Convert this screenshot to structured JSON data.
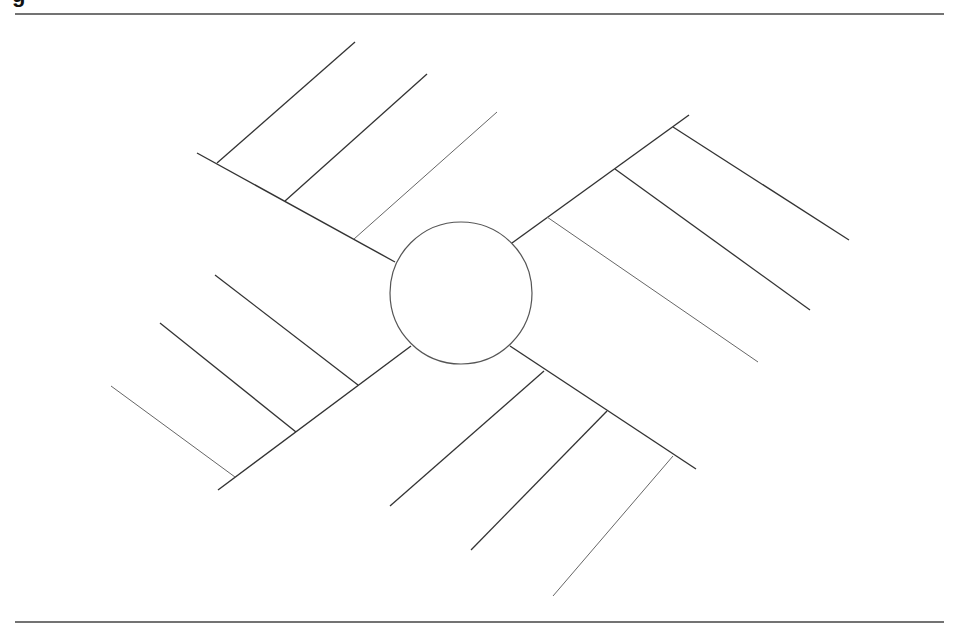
{
  "heading_fragment": "g",
  "colors": {
    "stroke_dark": "#333333",
    "stroke_light": "#666666",
    "background": "#ffffff"
  },
  "diagram": {
    "type": "spider-map",
    "top_rule": {
      "x1": 15,
      "y1": 14,
      "x2": 944,
      "y2": 14
    },
    "bottom_rule": {
      "x1": 15,
      "y1": 622,
      "x2": 944,
      "y2": 622
    },
    "center": {
      "cx": 461,
      "cy": 293,
      "r": 71,
      "label": ""
    },
    "arms": [
      {
        "name": "upper-left",
        "line": [
          197,
          153,
          395,
          262
        ],
        "branches": [
          [
            217,
            163,
            355,
            42
          ],
          [
            285,
            201,
            427,
            74
          ],
          [
            354,
            239,
            497,
            112
          ]
        ]
      },
      {
        "name": "upper-right",
        "line": [
          512,
          243,
          689,
          115
        ],
        "branches": [
          [
            673,
            127,
            849,
            240
          ],
          [
            615,
            169,
            810,
            310
          ],
          [
            547,
            217,
            758,
            362
          ]
        ]
      },
      {
        "name": "lower-left",
        "line": [
          218,
          490,
          411,
          346
        ],
        "branches": [
          [
            358,
            385,
            215,
            275
          ],
          [
            296,
            432,
            160,
            323
          ],
          [
            235,
            477,
            111,
            386
          ]
        ]
      },
      {
        "name": "lower-right",
        "line": [
          510,
          346,
          696,
          469
        ],
        "branches": [
          [
            544,
            371,
            390,
            506
          ],
          [
            607,
            411,
            471,
            550
          ],
          [
            673,
            456,
            553,
            596
          ]
        ]
      }
    ]
  }
}
